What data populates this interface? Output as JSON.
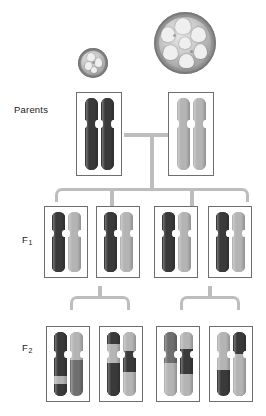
{
  "labels": {
    "parents": "Parents",
    "f1_base": "F",
    "f1_sub": "1",
    "f2_base": "F",
    "f2_sub": "2"
  },
  "colors": {
    "dark_allele": "#3a3a3a",
    "light_allele": "#b4b4b4",
    "mid_allele": "#6f6f6f",
    "connector": "#bdbdbd",
    "box_border": "#6e6e6e",
    "background": "#ffffff",
    "text": "#1a1a1a"
  },
  "fruits": [
    {
      "name": "small-fruit",
      "phenotype": "small",
      "parent_of": "dark-homozygote",
      "diameter_px": 30,
      "locules": 4
    },
    {
      "name": "large-fruit",
      "phenotype": "large",
      "parent_of": "light-homozygote",
      "diameter_px": 62,
      "locules": 7
    }
  ],
  "generations": [
    {
      "id": "parents",
      "label": "Parents",
      "boxes": [
        {
          "name": "parent-box-dark",
          "genotype": "homozygous-dark",
          "chromosomes": [
            {
              "segments": [
                {
                  "color": "dark",
                  "pct": 100
                }
              ]
            },
            {
              "segments": [
                {
                  "color": "dark",
                  "pct": 100
                }
              ]
            }
          ]
        },
        {
          "name": "parent-box-light",
          "genotype": "homozygous-light",
          "chromosomes": [
            {
              "segments": [
                {
                  "color": "light",
                  "pct": 100
                }
              ]
            },
            {
              "segments": [
                {
                  "color": "light",
                  "pct": 100
                }
              ]
            }
          ]
        }
      ]
    },
    {
      "id": "f1",
      "label": "F1",
      "boxes": [
        {
          "name": "f1-box-1",
          "genotype": "heterozygous",
          "chromosomes": [
            {
              "segments": [
                {
                  "color": "dark",
                  "pct": 100
                }
              ]
            },
            {
              "segments": [
                {
                  "color": "light",
                  "pct": 100
                }
              ]
            }
          ]
        },
        {
          "name": "f1-box-2",
          "genotype": "heterozygous",
          "chromosomes": [
            {
              "segments": [
                {
                  "color": "dark",
                  "pct": 100
                }
              ]
            },
            {
              "segments": [
                {
                  "color": "light",
                  "pct": 100
                }
              ]
            }
          ]
        },
        {
          "name": "f1-box-3",
          "genotype": "heterozygous",
          "chromosomes": [
            {
              "segments": [
                {
                  "color": "dark",
                  "pct": 100
                }
              ]
            },
            {
              "segments": [
                {
                  "color": "light",
                  "pct": 100
                }
              ]
            }
          ]
        },
        {
          "name": "f1-box-4",
          "genotype": "heterozygous",
          "chromosomes": [
            {
              "segments": [
                {
                  "color": "dark",
                  "pct": 100
                }
              ]
            },
            {
              "segments": [
                {
                  "color": "light",
                  "pct": 100
                }
              ]
            }
          ]
        }
      ]
    },
    {
      "id": "f2",
      "label": "F2",
      "boxes": [
        {
          "name": "f2-box-1",
          "genotype": "recombinant",
          "chromosomes": [
            {
              "segments": [
                {
                  "color": "dark",
                  "pct": 68
                },
                {
                  "color": "light",
                  "pct": 14
                },
                {
                  "color": "dark",
                  "pct": 18
                }
              ]
            },
            {
              "segments": [
                {
                  "color": "light",
                  "pct": 44
                },
                {
                  "color": "mid",
                  "pct": 56
                }
              ]
            }
          ]
        },
        {
          "name": "f2-box-2",
          "genotype": "recombinant",
          "chromosomes": [
            {
              "segments": [
                {
                  "color": "dark",
                  "pct": 18
                },
                {
                  "color": "light",
                  "pct": 30
                },
                {
                  "color": "dark",
                  "pct": 52
                }
              ]
            },
            {
              "segments": [
                {
                  "color": "light",
                  "pct": 30
                },
                {
                  "color": "dark",
                  "pct": 32
                },
                {
                  "color": "light",
                  "pct": 38
                }
              ]
            }
          ]
        },
        {
          "name": "f2-box-3",
          "genotype": "recombinant",
          "chromosomes": [
            {
              "segments": [
                {
                  "color": "mid",
                  "pct": 48
                },
                {
                  "color": "light",
                  "pct": 52
                }
              ]
            },
            {
              "segments": [
                {
                  "color": "light",
                  "pct": 26
                },
                {
                  "color": "dark",
                  "pct": 40
                },
                {
                  "color": "light",
                  "pct": 34
                }
              ]
            }
          ]
        },
        {
          "name": "f2-box-4",
          "genotype": "recombinant",
          "chromosomes": [
            {
              "segments": [
                {
                  "color": "light",
                  "pct": 60
                },
                {
                  "color": "dark",
                  "pct": 40
                }
              ]
            },
            {
              "segments": [
                {
                  "color": "dark",
                  "pct": 34
                },
                {
                  "color": "light",
                  "pct": 66
                }
              ]
            }
          ]
        }
      ]
    }
  ]
}
